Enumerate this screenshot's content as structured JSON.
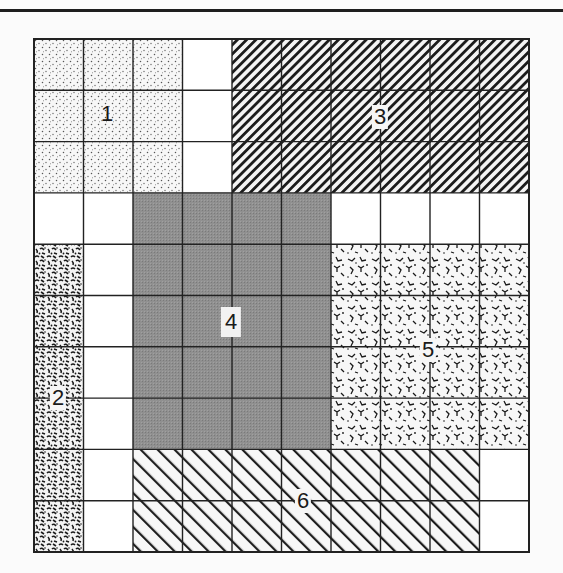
{
  "diagram": {
    "grid": {
      "columns": 10,
      "rows": 10,
      "line_color": "#222222",
      "background": "#ffffff"
    },
    "regions": [
      {
        "id": "1",
        "label": "1",
        "pattern": "stipple",
        "col_start": 0,
        "col_end": 2,
        "row_start": 0,
        "row_end": 2,
        "label_pos": {
          "x": 73,
          "y": 75
        }
      },
      {
        "id": "2",
        "label": "2",
        "pattern": "dense-noise",
        "col_start": 0,
        "col_end": 0,
        "row_start": 4,
        "row_end": 9,
        "label_pos": {
          "x": 24,
          "y": 359
        }
      },
      {
        "id": "3",
        "label": "3",
        "pattern": "dense-backslash-hatch",
        "col_start": 4,
        "col_end": 9,
        "row_start": 0,
        "row_end": 2,
        "label_pos": {
          "x": 346,
          "y": 78
        }
      },
      {
        "id": "4",
        "label": "4",
        "pattern": "solid-gray",
        "col_start": 2,
        "col_end": 5,
        "row_start": 3,
        "row_end": 7,
        "label_pos": {
          "x": 197,
          "y": 283
        }
      },
      {
        "id": "5",
        "label": "5",
        "pattern": "crackle",
        "col_start": 6,
        "col_end": 9,
        "row_start": 4,
        "row_end": 7,
        "label_pos": {
          "x": 394,
          "y": 311
        }
      },
      {
        "id": "6",
        "label": "6",
        "pattern": "sparse-slash-hatch",
        "col_start": 2,
        "col_end": 8,
        "row_start": 8,
        "row_end": 9,
        "label_pos": {
          "x": 269,
          "y": 462
        }
      }
    ],
    "colors": {
      "gray_fill": "#8c8c8c",
      "ink": "#1a1a1a",
      "top_rule": "#1e1e1e"
    }
  }
}
